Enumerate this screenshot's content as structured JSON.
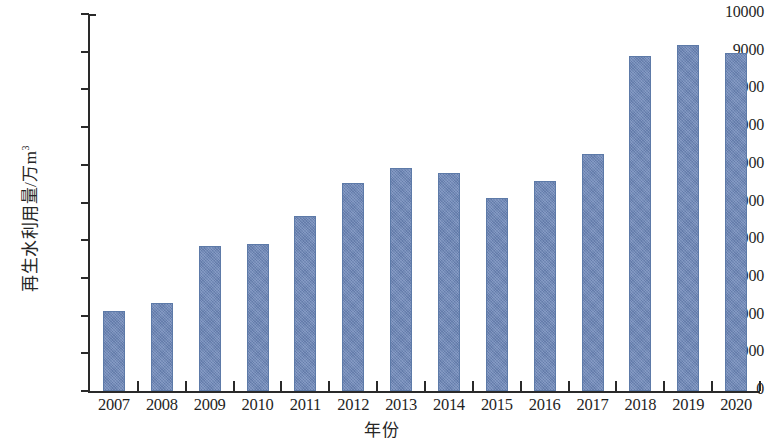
{
  "chart_data": {
    "type": "bar",
    "title": "",
    "xlabel": "年份",
    "ylabel": "再生水利用量/万m³",
    "ylabel_main": "再生水利用量/万m",
    "ylabel_sup": "3",
    "categories": [
      "2007",
      "2008",
      "2009",
      "2010",
      "2011",
      "2012",
      "2013",
      "2014",
      "2015",
      "2016",
      "2017",
      "2018",
      "2019",
      "2020"
    ],
    "values": [
      2120,
      2330,
      3840,
      3890,
      4650,
      5530,
      5920,
      5780,
      5120,
      5580,
      6290,
      8880,
      9180,
      8960
    ],
    "series": [
      {
        "name": "再生水利用量",
        "values": [
          2120,
          2330,
          3840,
          3890,
          4650,
          5530,
          5920,
          5780,
          5120,
          5580,
          6290,
          8880,
          9180,
          8960
        ]
      }
    ],
    "ylim": [
      0,
      10000
    ],
    "ytick_step": 1000,
    "yticks": [
      "0",
      "1000",
      "2000",
      "3000",
      "4000",
      "5000",
      "6000",
      "7000",
      "8000",
      "9000",
      "10000"
    ],
    "grid": false,
    "legend": false,
    "bar_color": "#6d87b8",
    "axis_color": "#2a2a2a"
  }
}
